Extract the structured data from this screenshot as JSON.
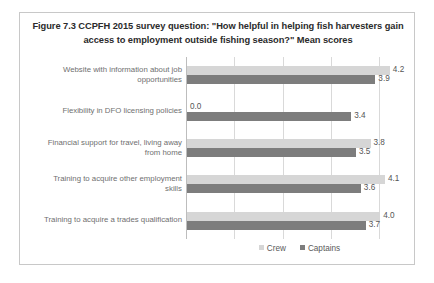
{
  "figure": {
    "title": "Figure 7.3 CCPFH 2015 survey question: \"How helpful in helping fish harvesters gain access to employment outside fishing season?\" Mean scores",
    "frame_color": "#c8c8c8"
  },
  "legend": {
    "position": "bottom-center",
    "entries": [
      {
        "label": "Crew",
        "color": "#d6d6d6"
      },
      {
        "label": "Captains",
        "color": "#7d7d7d"
      }
    ]
  },
  "chart_data": {
    "type": "bar",
    "orientation": "horizontal",
    "title": "Figure 7.3 CCPFH 2015 survey question: \"How helpful in helping fish harvesters gain access to employment outside fishing season?\" Mean scores",
    "xlabel": "",
    "ylabel": "",
    "xlim": [
      0,
      4.7
    ],
    "grid": true,
    "gridlines_x": [
      0,
      1,
      2,
      3,
      4
    ],
    "tick_labels_x": [],
    "data_labels": true,
    "categories": [
      "Website with information about job opportunities",
      "Flexibility in DFO licensing policies",
      "Financial support for travel, living away from home",
      "Training to acquire other employment skills",
      "Training to acquire a trades qualification"
    ],
    "series": [
      {
        "name": "Crew",
        "color": "#d6d6d6",
        "values": [
          4.2,
          0.0,
          3.8,
          4.1,
          4.0
        ],
        "labels": [
          "4.2",
          "0.0",
          "3.8",
          "4.1",
          "4.0"
        ]
      },
      {
        "name": "Captains",
        "color": "#7d7d7d",
        "values": [
          3.9,
          3.4,
          3.5,
          3.6,
          3.7
        ],
        "labels": [
          "3.9",
          "3.4",
          "3.5",
          "3.6",
          "3.7"
        ]
      }
    ]
  }
}
